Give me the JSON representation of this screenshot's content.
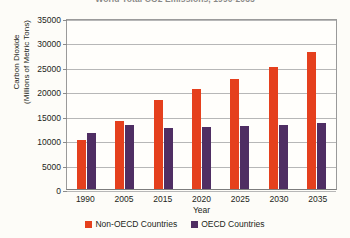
{
  "chart_data": {
    "type": "bar",
    "title": "World Total CO2 Emissions, 1990-2035",
    "xlabel": "Year",
    "ylabel_line1": "Carbon Dioxide",
    "ylabel_line2": "(Millions of Metric Tons)",
    "categories": [
      "1990",
      "2005",
      "2015",
      "2020",
      "2025",
      "2030",
      "2035"
    ],
    "series": [
      {
        "name": "Non-OECD Countries",
        "color": "#e5401d",
        "values": [
          10000,
          14000,
          18300,
          20500,
          22500,
          25000,
          28000
        ]
      },
      {
        "name": "OECD Countries",
        "color": "#4f2e63",
        "values": [
          11400,
          13100,
          12500,
          12600,
          12900,
          13200,
          13500
        ]
      }
    ],
    "ylim": [
      0,
      35000
    ],
    "yticks": [
      "35000",
      "30000",
      "25000",
      "20000",
      "15000",
      "10000",
      "5000",
      "0"
    ],
    "grid": true,
    "legend_position": "bottom"
  }
}
